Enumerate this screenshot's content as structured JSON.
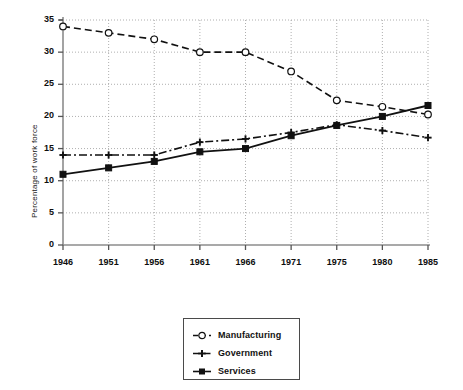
{
  "chart_data": {
    "type": "line",
    "title": "",
    "xlabel": "",
    "ylabel": "Percentage of work force",
    "categories": [
      "1946",
      "1951",
      "1956",
      "1961",
      "1966",
      "1971",
      "1975",
      "1980",
      "1985"
    ],
    "x": [
      1946,
      1951,
      1956,
      1961,
      1966,
      1971,
      1975,
      1980,
      1985
    ],
    "ylim": [
      0,
      35
    ],
    "ytick_labels": [
      "0",
      "5",
      "10",
      "15",
      "20",
      "25",
      "30",
      "35"
    ],
    "ytick_values": [
      0,
      5,
      10,
      15,
      20,
      25,
      30,
      35
    ],
    "grid": true,
    "legend_position": "below-plot",
    "series": [
      {
        "name": "Manufacturing",
        "marker": "open-circle",
        "line_style": "dashed",
        "color": "#111111",
        "values": [
          34,
          33,
          32,
          30,
          30,
          27,
          22.5,
          21.5,
          20.3
        ]
      },
      {
        "name": "Government",
        "marker": "plus",
        "line_style": "dash-dot",
        "color": "#111111",
        "values": [
          14,
          14,
          14,
          16,
          16.5,
          17.5,
          18.7,
          17.8,
          16.7
        ]
      },
      {
        "name": "Services",
        "marker": "filled-square",
        "line_style": "solid",
        "color": "#111111",
        "values": [
          11,
          12,
          13,
          14.5,
          15,
          17,
          18.6,
          20,
          21.7
        ]
      }
    ]
  },
  "legend": {
    "items": [
      {
        "label": "Manufacturing",
        "marker": "open-circle-icon"
      },
      {
        "label": "Government",
        "marker": "plus-marker-icon"
      },
      {
        "label": "Services",
        "marker": "filled-square-icon"
      }
    ]
  }
}
